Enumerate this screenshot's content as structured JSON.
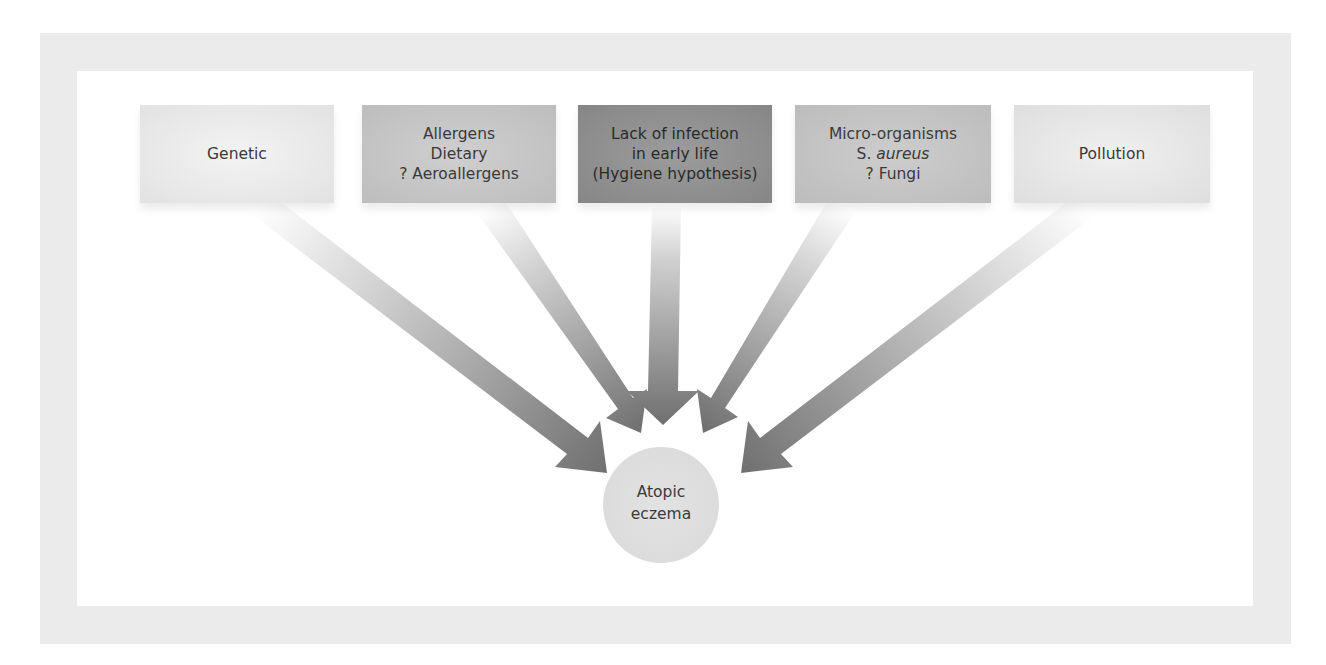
{
  "diagram": {
    "type": "converging-factors",
    "colors": {
      "frame": "#ebebeb",
      "background": "#ffffff",
      "arrow_start": "#f2f2f2",
      "arrow_end": "#707070",
      "text": "#3a3a3a"
    },
    "factors": [
      {
        "id": "genetic",
        "lines": [
          "Genetic"
        ],
        "shade": "#e8e8e8"
      },
      {
        "id": "allergens",
        "lines": [
          "Allergens",
          "Dietary",
          "? Aeroallergens"
        ],
        "shade": "#c6c6c6"
      },
      {
        "id": "hygiene",
        "lines": [
          "Lack of infection",
          "in early life",
          "(Hygiene hypothesis)"
        ],
        "shade": "#919191"
      },
      {
        "id": "micro-organisms",
        "lines": [
          "Micro-organisms",
          "S. aureus",
          "? Fungi"
        ],
        "italic_line": 1,
        "shade": "#c4c4c4"
      },
      {
        "id": "pollution",
        "lines": [
          "Pollution"
        ],
        "shade": "#e6e6e6"
      }
    ],
    "outcome": {
      "lines": [
        "Atopic",
        "eczema"
      ]
    }
  }
}
